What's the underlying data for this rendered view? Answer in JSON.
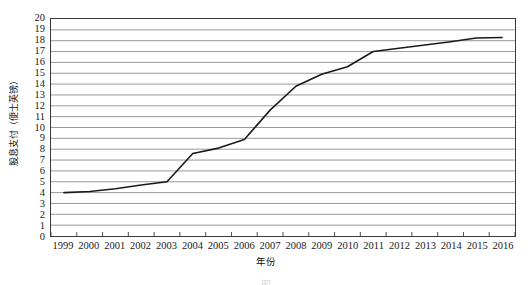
{
  "chart_data": {
    "type": "line",
    "title": "",
    "subtitle": "",
    "xlabel": "年份",
    "ylabel": "股息支付（便士英镑）",
    "xlim": [
      1999,
      2016
    ],
    "ylim": [
      0,
      20
    ],
    "y_tick_step": 1,
    "grid": "horizontal",
    "legend": "none",
    "line_color": "#1a1a1a",
    "gridline_color": "#8c8c8c",
    "border_color": "#3a3a3a",
    "categories": [
      "1999",
      "2000",
      "2001",
      "2002",
      "2003",
      "2004",
      "2005",
      "2006",
      "2007",
      "2008",
      "2009",
      "2010",
      "2011",
      "2012",
      "2013",
      "2014",
      "2015",
      "2016"
    ],
    "series": [
      {
        "name": "股息支付",
        "values": [
          4.0,
          4.1,
          4.35,
          4.7,
          5.0,
          7.6,
          8.1,
          8.9,
          11.6,
          13.8,
          14.9,
          15.6,
          17.0,
          17.3,
          17.6,
          17.9,
          18.25,
          18.3
        ]
      }
    ],
    "y_tick_labels": [
      "20",
      "19",
      "18",
      "17",
      "16",
      "15",
      "14",
      "13",
      "12",
      "11",
      "10",
      "9",
      "8",
      "7",
      "6",
      "5",
      "4",
      "3",
      "2",
      "1",
      "0"
    ]
  },
  "caption": {
    "text": "图"
  }
}
